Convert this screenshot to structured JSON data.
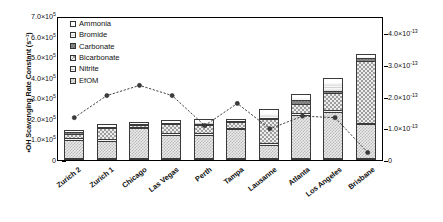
{
  "chart_data": {
    "type": "bar",
    "title": "",
    "subtitle": "",
    "xlabel": "",
    "ylabel": "•OH Scavenging Rate Constant (s⁻¹)",
    "ylabel_right": "Rₒₕ,ᵤᵥ [M×s/(mJ/cm³)]",
    "stacked": true,
    "grid": false,
    "legend_position": "top-left-inside",
    "categories": [
      "Zurich 2",
      "Zurich 1",
      "Chicago",
      "Las Vegas",
      "Perth",
      "Tampa",
      "Lausanne",
      "Atlanta",
      "Los Angeles",
      "Brisbane"
    ],
    "ylim": [
      0,
      700000
    ],
    "yticks": [
      0,
      100000,
      200000,
      300000,
      400000,
      500000,
      600000,
      700000
    ],
    "ytick_labels": [
      "0",
      "1.0×10⁵",
      "2.0×10⁵",
      "3.0×10⁵",
      "4.0×10⁵",
      "5.0×10⁵",
      "6.0×10⁵",
      "7.0×10⁵"
    ],
    "ylim_right": [
      0,
      4.55e-13
    ],
    "yticks_right": [
      0,
      1e-13,
      2e-13,
      3e-13,
      4e-13
    ],
    "ytick_labels_right": [
      "0",
      "1.0×10⁻¹³",
      "2.0×10⁻¹³",
      "3.0×10⁻¹³",
      "4.0×10⁻¹³"
    ],
    "series": [
      {
        "name": "EfOM",
        "pattern": "p-efom",
        "values": [
          95000,
          90000,
          155000,
          120000,
          120000,
          150000,
          65000,
          215000,
          230000,
          170000
        ]
      },
      {
        "name": "Nitrite",
        "pattern": "p-nitrite",
        "values": [
          10000,
          10000,
          5000,
          10000,
          10000,
          5000,
          10000,
          10000,
          10000,
          5000
        ]
      },
      {
        "name": "Bicarbonate",
        "pattern": "p-bicarb",
        "values": [
          20000,
          55000,
          10000,
          45000,
          40000,
          30000,
          120000,
          45000,
          85000,
          305000
        ]
      },
      {
        "name": "Carbonate",
        "pattern": "p-carb",
        "values": [
          10000,
          5000,
          5000,
          5000,
          5000,
          5000,
          5000,
          20000,
          10000,
          15000
        ]
      },
      {
        "name": "Bromide",
        "pattern": "p-bromide",
        "values": [
          5000,
          5000,
          5000,
          5000,
          15000,
          5000,
          30000,
          15000,
          45000,
          10000
        ]
      },
      {
        "name": "Ammonia",
        "pattern": "p-ammonia",
        "values": [
          5000,
          10000,
          5000,
          10000,
          10000,
          5000,
          20000,
          15000,
          20000,
          10000
        ]
      }
    ],
    "overlay_series": {
      "name": "R_OH,UV",
      "axis": "right",
      "marker": "filled-circle",
      "linestyle": "dashed",
      "values": [
        1.4e-13,
        2.1e-13,
        2.42e-13,
        2.1e-13,
        1.15e-13,
        1.85e-13,
        1.05e-13,
        1.45e-13,
        1.4e-13,
        3e-14
      ]
    },
    "legend": [
      {
        "label": "Ammonia",
        "pattern": "p-ammonia"
      },
      {
        "label": "Bromide",
        "pattern": "p-bromide"
      },
      {
        "label": "Carbonate",
        "pattern": "p-carb"
      },
      {
        "label": "Bicarbonate",
        "pattern": "p-bicarb"
      },
      {
        "label": "Nitrite",
        "pattern": "p-nitrite"
      },
      {
        "label": "EfOM",
        "pattern": "p-efom"
      }
    ],
    "colors": {
      "axis": "#000000",
      "line": "#2b2b2b",
      "marker": "#3c3c3c",
      "bar_outline": "#3a3a3a"
    }
  }
}
